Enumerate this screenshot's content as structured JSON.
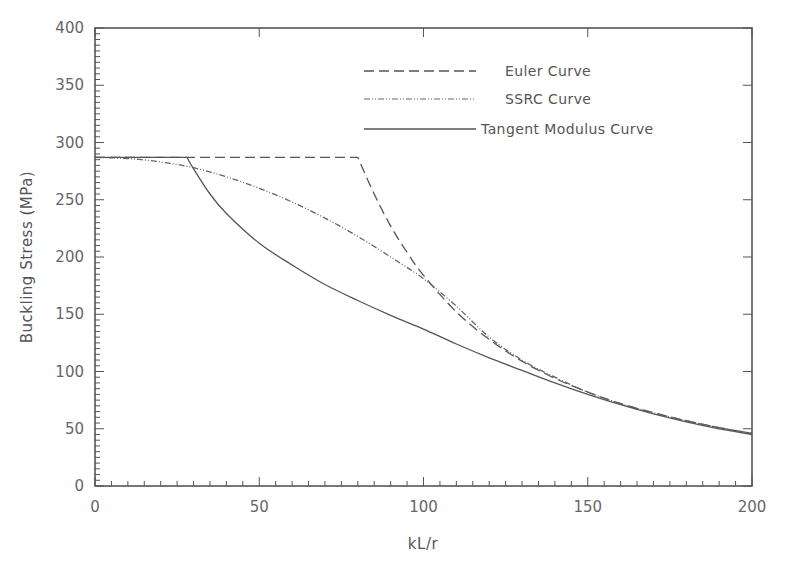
{
  "chart_data": {
    "type": "line",
    "title": "",
    "xlabel": "kL/r",
    "ylabel": "Buckling Stress (MPa)",
    "xlim": [
      0,
      200
    ],
    "ylim": [
      0,
      400
    ],
    "x_ticks": [
      0,
      50,
      100,
      150,
      200
    ],
    "y_ticks": [
      0,
      50,
      100,
      150,
      200,
      250,
      300,
      350,
      400
    ],
    "x_minor_step": 5,
    "y_minor_step": 5,
    "grid": false,
    "legend_position": "upper right",
    "yield_stress": 287,
    "series": [
      {
        "name": "Euler Curve",
        "style": "dashed",
        "x": [
          0,
          80,
          85,
          90,
          95,
          100,
          110,
          120,
          130,
          140,
          150,
          160,
          170,
          180,
          190,
          200
        ],
        "y": [
          287,
          287,
          255,
          227,
          204,
          184,
          152,
          128,
          109,
          94,
          82,
          72,
          64,
          57,
          51,
          46
        ]
      },
      {
        "name": "SSRC Curve",
        "style": "dash-dot-dot",
        "x": [
          0,
          10,
          20,
          30,
          40,
          50,
          60,
          70,
          80,
          90,
          100,
          110,
          120,
          130,
          140,
          150,
          160,
          170,
          180,
          190,
          200
        ],
        "y": [
          287,
          286,
          283,
          278,
          270,
          260,
          248,
          234,
          218,
          200,
          181,
          157,
          130,
          110,
          95,
          82,
          72,
          64,
          57,
          51,
          46
        ]
      },
      {
        "name": "Tangent Modulus Curve",
        "style": "solid",
        "x": [
          0,
          28,
          30,
          35,
          40,
          50,
          60,
          70,
          80,
          90,
          100,
          110,
          120,
          130,
          140,
          150,
          160,
          170,
          180,
          190,
          200
        ],
        "y": [
          287,
          287,
          277,
          255,
          238,
          212,
          193,
          176,
          162,
          149,
          137,
          124,
          112,
          101,
          90,
          80,
          71,
          63,
          56,
          50,
          45
        ]
      }
    ]
  },
  "legend": {
    "items": [
      {
        "label": "Euler Curve"
      },
      {
        "label": "SSRC Curve"
      },
      {
        "label": "Tangent Modulus Curve"
      }
    ]
  }
}
